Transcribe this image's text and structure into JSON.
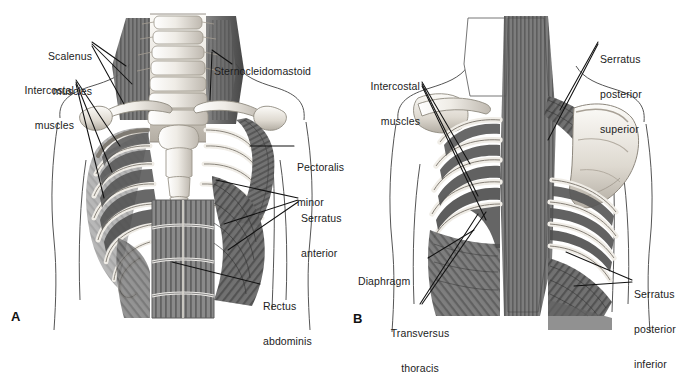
{
  "figure": {
    "type": "anatomical-illustration",
    "style": "grayscale pencil rendering",
    "panels": [
      {
        "id": "A",
        "letter": "A",
        "view": "anterior",
        "labels": [
          {
            "name": "scalenus-muscles",
            "text": "Scalenus\nmuscles",
            "align": "right"
          },
          {
            "name": "intercostal-muscles",
            "text": "Intercostal\nmuscles",
            "align": "right"
          },
          {
            "name": "sternocleidomastoid",
            "text": "Sternocleidomastoid",
            "align": "left"
          },
          {
            "name": "pectoralis-minor",
            "text": "Pectoralis\nminor",
            "align": "left"
          },
          {
            "name": "serratus-anterior",
            "text": "Serratus\nanterior",
            "align": "left"
          },
          {
            "name": "rectus-abdominis",
            "text": "Rectus\nabdominis",
            "align": "left"
          }
        ]
      },
      {
        "id": "B",
        "letter": "B",
        "view": "posterior",
        "labels": [
          {
            "name": "intercostal-muscles",
            "text": "Intercostal\nmuscles",
            "align": "right"
          },
          {
            "name": "serratus-posterior-superior",
            "text": "Serratus\nposterior\nsuperior",
            "align": "left"
          },
          {
            "name": "diaphragm",
            "text": "Diaphragm",
            "align": "left"
          },
          {
            "name": "transversus-thoracis",
            "text": "Transversus\nthoracis",
            "align": "center"
          },
          {
            "name": "serratus-posterior-inferior",
            "text": "Serratus\nposterior\ninferior",
            "align": "left"
          }
        ]
      }
    ],
    "panelA": {
      "scalenus_line1": "Scalenus",
      "scalenus_line2": "muscles",
      "intercostal_line1": "Intercostal",
      "intercostal_line2": "muscles",
      "sternocleidomastoid": "Sternocleidomastoid",
      "pectoralis_line1": "Pectoralis",
      "pectoralis_line2": "minor",
      "serratus_line1": "Serratus",
      "serratus_line2": "anterior",
      "rectus_line1": "Rectus",
      "rectus_line2": "abdominis",
      "letter": "A"
    },
    "panelB": {
      "intercostal_line1": "Intercostal",
      "intercostal_line2": "muscles",
      "sps_line1": "Serratus",
      "sps_line2": "posterior",
      "sps_line3": "superior",
      "diaphragm": "Diaphragm",
      "transversus_line1": "Transversus",
      "transversus_line2": "thoracis",
      "spi_line1": "Serratus",
      "spi_line2": "posterior",
      "spi_line3": "inferior",
      "letter": "B"
    },
    "colors": {
      "background": "#ffffff",
      "label_text": "#1c1c1c",
      "leader_line": "#111111",
      "body_outline": "#555555",
      "bone_light": "#f2f0ec",
      "bone_mid": "#cfcac2",
      "muscle_dark": "#4a4a4a",
      "muscle_mid": "#6e6e6e",
      "muscle_light": "#9a9a9a"
    }
  }
}
